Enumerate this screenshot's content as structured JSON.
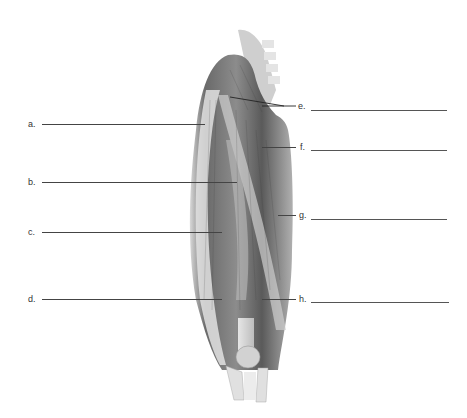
{
  "figure": {
    "labels_left": [
      {
        "id": "a",
        "text": "a.",
        "y": 124
      },
      {
        "id": "b",
        "text": "b.",
        "y": 182
      },
      {
        "id": "c",
        "text": "c.",
        "y": 232
      },
      {
        "id": "d",
        "text": "d.",
        "y": 299
      }
    ],
    "labels_right": [
      {
        "id": "e",
        "text": "e.",
        "y": 106
      },
      {
        "id": "f",
        "text": "f.",
        "y": 147
      },
      {
        "id": "g",
        "text": "g.",
        "y": 215
      },
      {
        "id": "h",
        "text": "h.",
        "y": 299
      }
    ],
    "answers": {
      "a": "",
      "b": "",
      "c": "",
      "d": "",
      "e": "",
      "f": "",
      "g": "",
      "h": ""
    }
  }
}
